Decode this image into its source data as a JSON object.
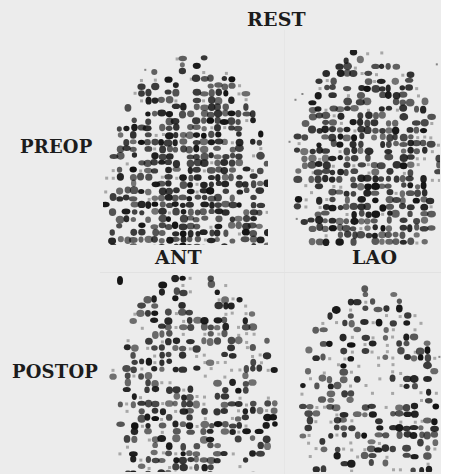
{
  "figure": {
    "column_header": "REST",
    "row_labels": [
      "PREOP",
      "POSTOP"
    ],
    "view_labels": [
      "ANT",
      "LAO"
    ],
    "background_color": "#ececec",
    "ink_color": "#151515"
  },
  "panels": [
    {
      "id": "preop-ant",
      "row": "PREOP",
      "view": "ANT",
      "seed": 11,
      "density": 0.78,
      "shape": "dome-fill",
      "defect": "none"
    },
    {
      "id": "preop-lao",
      "row": "PREOP",
      "view": "LAO",
      "seed": 23,
      "density": 0.66,
      "shape": "dome",
      "defect": "none"
    },
    {
      "id": "postop-ant",
      "row": "POSTOP",
      "view": "ANT",
      "seed": 37,
      "density": 0.52,
      "shape": "dome",
      "defect": "center"
    },
    {
      "id": "postop-lao",
      "row": "POSTOP",
      "view": "LAO",
      "seed": 41,
      "density": 0.46,
      "shape": "dome",
      "defect": "upper-center"
    }
  ]
}
